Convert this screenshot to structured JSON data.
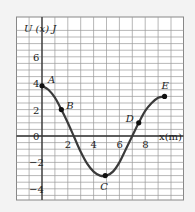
{
  "chart_data": {
    "type": "line",
    "title": "",
    "xlabel": "x(m)",
    "ylabel": "U (x) J",
    "xlim": [
      -2,
      10.8
    ],
    "ylim": [
      -5,
      7
    ],
    "grid": true,
    "x_ticks": [
      2,
      4,
      6,
      8
    ],
    "y_ticks": [
      6,
      4,
      2,
      0,
      -2,
      -4
    ],
    "x_tick_labels": [
      "2",
      "4",
      "6",
      "8"
    ],
    "y_tick_labels": [
      "6",
      "4",
      "2",
      "0",
      "−2",
      "−4"
    ],
    "curve": {
      "x": [
        0,
        0.5,
        1,
        1.5,
        2,
        2.5,
        3,
        3.5,
        4,
        4.5,
        5,
        5.5,
        6,
        6.5,
        7,
        7.5,
        8,
        8.5,
        9,
        9.5
      ],
      "y": [
        3.8,
        3.5,
        2.9,
        2.0,
        1.0,
        -0.1,
        -1.2,
        -2.1,
        -2.7,
        -3.0,
        -3.0,
        -2.7,
        -2.0,
        -1.0,
        0.0,
        1.0,
        1.9,
        2.5,
        2.9,
        3.0
      ]
    },
    "points": [
      {
        "label": "A",
        "x": 0,
        "y": 3.8
      },
      {
        "label": "B",
        "x": 1.5,
        "y": 2.0
      },
      {
        "label": "C",
        "x": 4.9,
        "y": -3.0
      },
      {
        "label": "D",
        "x": 7.5,
        "y": 1.0
      },
      {
        "label": "E",
        "x": 9.5,
        "y": 3.0
      }
    ],
    "colors": {
      "curve": "#3a3a3a",
      "grid": "#9a9a9a",
      "background": "#ffffff"
    }
  }
}
